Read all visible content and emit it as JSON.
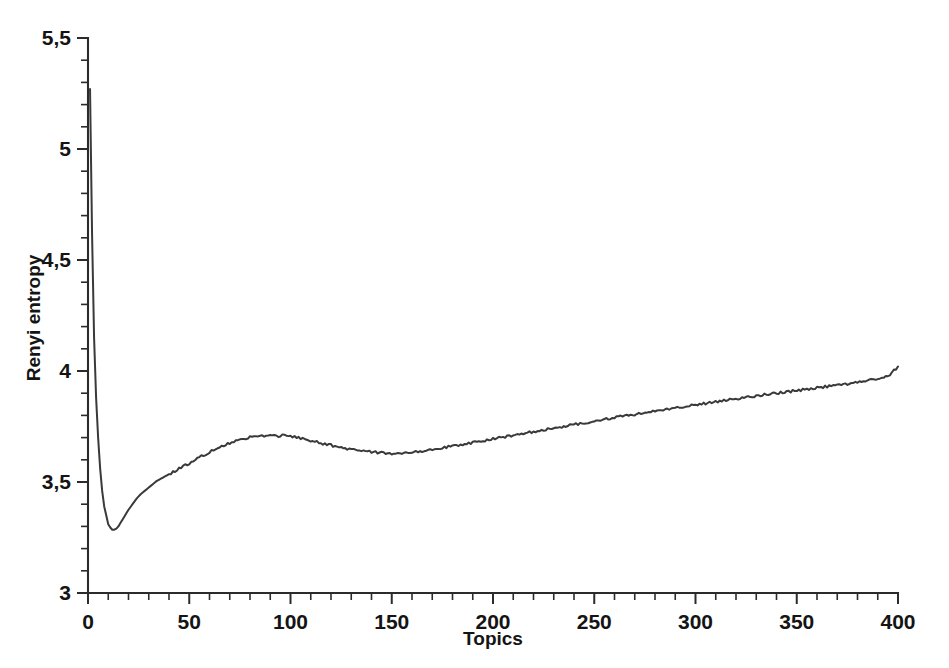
{
  "chart_data": {
    "type": "line",
    "title": "",
    "xlabel": "Topics",
    "ylabel": "Renyi entropy",
    "xlim": [
      0,
      400
    ],
    "ylim": [
      3,
      5.5
    ],
    "grid": false,
    "legend": null,
    "decimal_separator": ",",
    "x_ticklabels": [
      "0",
      "50",
      "100",
      "150",
      "200",
      "250",
      "300",
      "350",
      "400"
    ],
    "x_tickvalues": [
      0,
      50,
      100,
      150,
      200,
      250,
      300,
      350,
      400
    ],
    "x_minor_step": 10,
    "y_ticklabels": [
      "3",
      "3,5",
      "4",
      "4,5",
      "5",
      "5,5"
    ],
    "y_tickvalues": [
      3,
      3.5,
      4,
      4.5,
      5,
      5.5
    ],
    "y_minor_step": 0.1,
    "line_color": "#3a3a3a",
    "annotations": {
      "start_value": 5.27,
      "global_minimum": {
        "x": 12,
        "y": 3.28
      },
      "local_maximum": {
        "x": 92,
        "y": 3.71
      },
      "local_minimum": {
        "x": 150,
        "y": 3.63
      },
      "end_value": {
        "x": 400,
        "y": 4.02
      }
    },
    "series": [
      {
        "name": "Renyi entropy",
        "x": [
          1,
          2,
          3,
          4,
          5,
          6,
          7,
          8,
          9,
          10,
          11,
          12,
          13,
          14,
          15,
          16,
          17,
          18,
          19,
          20,
          22,
          24,
          26,
          28,
          30,
          32,
          34,
          36,
          38,
          40,
          42,
          44,
          46,
          48,
          50,
          52,
          54,
          56,
          58,
          60,
          62,
          64,
          66,
          68,
          70,
          72,
          74,
          76,
          78,
          80,
          82,
          84,
          86,
          88,
          90,
          92,
          94,
          96,
          98,
          100,
          102,
          104,
          106,
          108,
          110,
          112,
          114,
          116,
          118,
          120,
          122,
          124,
          126,
          128,
          130,
          132,
          134,
          136,
          138,
          140,
          142,
          144,
          146,
          148,
          150,
          152,
          154,
          156,
          158,
          160,
          162,
          164,
          166,
          168,
          170,
          175,
          180,
          185,
          190,
          195,
          200,
          205,
          210,
          215,
          220,
          225,
          230,
          235,
          240,
          245,
          250,
          255,
          260,
          265,
          270,
          275,
          280,
          285,
          290,
          295,
          300,
          305,
          310,
          315,
          320,
          325,
          330,
          335,
          340,
          345,
          350,
          355,
          360,
          365,
          370,
          375,
          380,
          385,
          390,
          395,
          400
        ],
        "y": [
          5.27,
          4.62,
          4.15,
          3.88,
          3.7,
          3.56,
          3.46,
          3.39,
          3.35,
          3.31,
          3.295,
          3.285,
          3.285,
          3.29,
          3.3,
          3.315,
          3.33,
          3.345,
          3.36,
          3.375,
          3.4,
          3.425,
          3.445,
          3.46,
          3.475,
          3.49,
          3.505,
          3.515,
          3.525,
          3.535,
          3.545,
          3.555,
          3.565,
          3.575,
          3.585,
          3.595,
          3.605,
          3.615,
          3.625,
          3.635,
          3.645,
          3.655,
          3.662,
          3.668,
          3.675,
          3.682,
          3.688,
          3.693,
          3.698,
          3.702,
          3.706,
          3.709,
          3.706,
          3.71,
          3.707,
          3.711,
          3.706,
          3.71,
          3.705,
          3.708,
          3.702,
          3.699,
          3.695,
          3.69,
          3.686,
          3.682,
          3.677,
          3.673,
          3.67,
          3.666,
          3.66,
          3.657,
          3.654,
          3.65,
          3.647,
          3.645,
          3.642,
          3.64,
          3.638,
          3.636,
          3.634,
          3.633,
          3.631,
          3.63,
          3.629,
          3.63,
          3.631,
          3.632,
          3.633,
          3.635,
          3.637,
          3.639,
          3.641,
          3.644,
          3.647,
          3.654,
          3.662,
          3.67,
          3.678,
          3.686,
          3.694,
          3.702,
          3.71,
          3.718,
          3.726,
          3.734,
          3.742,
          3.75,
          3.758,
          3.766,
          3.774,
          3.782,
          3.79,
          3.797,
          3.805,
          3.812,
          3.819,
          3.826,
          3.833,
          3.84,
          3.847,
          3.854,
          3.861,
          3.868,
          3.875,
          3.881,
          3.888,
          3.894,
          3.9,
          3.906,
          3.912,
          3.918,
          3.924,
          3.93,
          3.936,
          3.942,
          3.948,
          3.956,
          3.965,
          3.975,
          4.02
        ]
      }
    ]
  },
  "figure": {
    "background_color": "#ffffff",
    "plot_area": {
      "left": 88,
      "right": 898,
      "top": 38,
      "bottom": 593
    }
  }
}
